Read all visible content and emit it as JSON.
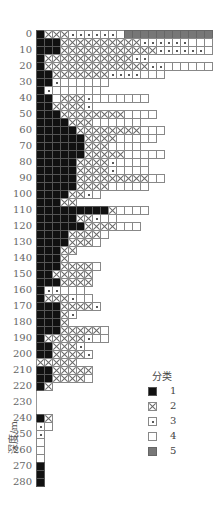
{
  "chart_data": {
    "type": "heatmap",
    "title": "",
    "ylabel": "深度/m",
    "xlabel": "",
    "y_ticks": [
      "0",
      "10",
      "20",
      "30",
      "40",
      "50",
      "60",
      "70",
      "80",
      "90",
      "100",
      "110",
      "120",
      "130",
      "140",
      "150",
      "160",
      "170",
      "180",
      "190",
      "200",
      "210",
      "220",
      "230",
      "240",
      "250",
      "260",
      "270",
      "280"
    ],
    "row_step_m": 5,
    "legend": {
      "title": "分类",
      "items": [
        {
          "code": 1,
          "label": "1",
          "pattern": "solid-black"
        },
        {
          "code": 2,
          "label": "2",
          "pattern": "cross-x"
        },
        {
          "code": 3,
          "label": "3",
          "pattern": "dot"
        },
        {
          "code": 4,
          "label": "4",
          "pattern": "white"
        },
        {
          "code": 5,
          "label": "5",
          "pattern": "gray"
        }
      ]
    },
    "rows": [
      {
        "depth": 0,
        "cells": "122233333345555555555555"
      },
      {
        "depth": 5,
        "cells": "1112222222222333333444455"
      },
      {
        "depth": 10,
        "cells": "111222222222222333333444"
      },
      {
        "depth": 15,
        "cells": "12222222222233"
      },
      {
        "depth": 20,
        "cells": "1222222222222233444444"
      },
      {
        "depth": 25,
        "cells": "1122222223333444"
      },
      {
        "depth": 30,
        "cells": "113444444"
      },
      {
        "depth": 35,
        "cells": "13444444"
      },
      {
        "depth": 40,
        "cells": "11422234444444"
      },
      {
        "depth": 45,
        "cells": "1122223"
      },
      {
        "depth": 50,
        "cells": "111222222224444"
      },
      {
        "depth": 55,
        "cells": "1111222444444"
      },
      {
        "depth": 60,
        "cells": "1111122222222444"
      },
      {
        "depth": 65,
        "cells": "111111222244444"
      },
      {
        "depth": 70,
        "cells": "1111112224444"
      },
      {
        "depth": 75,
        "cells": "1111112222244444"
      },
      {
        "depth": 80,
        "cells": "11111222234444"
      },
      {
        "depth": 85,
        "cells": "11111222234444"
      },
      {
        "depth": 90,
        "cells": "1111122222222244"
      },
      {
        "depth": 95,
        "cells": "11111222244444"
      },
      {
        "depth": 100,
        "cells": "11112234"
      },
      {
        "depth": 105,
        "cells": "11122"
      },
      {
        "depth": 110,
        "cells": "11111111124444"
      },
      {
        "depth": 115,
        "cells": "1111122344"
      },
      {
        "depth": 120,
        "cells": "1111112222444"
      },
      {
        "depth": 125,
        "cells": "111122224"
      },
      {
        "depth": 130,
        "cells": "11112224"
      },
      {
        "depth": 135,
        "cells": "11122"
      },
      {
        "depth": 140,
        "cells": "1112"
      },
      {
        "depth": 145,
        "cells": "11122224"
      },
      {
        "depth": 150,
        "cells": "1122222"
      },
      {
        "depth": 155,
        "cells": "1112222"
      },
      {
        "depth": 160,
        "cells": "133444"
      },
      {
        "depth": 165,
        "cells": "1222344"
      },
      {
        "depth": 170,
        "cells": "11122223"
      },
      {
        "depth": 175,
        "cells": "11123"
      },
      {
        "depth": 180,
        "cells": "1112"
      },
      {
        "depth": 185,
        "cells": "111222224"
      },
      {
        "depth": 190,
        "cells": "122222344"
      },
      {
        "depth": 195,
        "cells": "112223"
      },
      {
        "depth": 200,
        "cells": "1122223"
      },
      {
        "depth": 205,
        "cells": "22222"
      },
      {
        "depth": 210,
        "cells": "1122222"
      },
      {
        "depth": 215,
        "cells": "1122224"
      },
      {
        "depth": 220,
        "cells": "12"
      },
      {
        "depth": 225,
        "cells": ""
      },
      {
        "depth": 230,
        "cells": ""
      },
      {
        "depth": 235,
        "cells": ""
      },
      {
        "depth": 240,
        "cells": "12"
      },
      {
        "depth": 245,
        "cells": "34"
      },
      {
        "depth": 250,
        "cells": "3"
      },
      {
        "depth": 255,
        "cells": "4"
      },
      {
        "depth": 260,
        "cells": "4"
      },
      {
        "depth": 265,
        "cells": "4"
      },
      {
        "depth": 270,
        "cells": "1"
      },
      {
        "depth": 275,
        "cells": "1"
      },
      {
        "depth": 280,
        "cells": "1"
      }
    ]
  }
}
